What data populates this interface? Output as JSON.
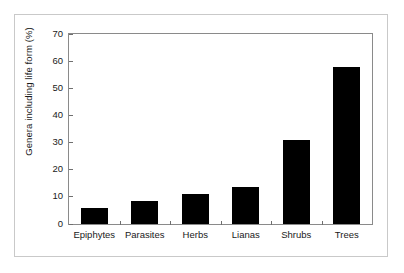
{
  "chart_data": {
    "type": "bar",
    "title": "",
    "xlabel": "",
    "ylabel": "Genera including life form (%)",
    "categories": [
      "Epiphytes",
      "Parasites",
      "Herbs",
      "Lianas",
      "Shrubs",
      "Trees"
    ],
    "values": [
      6,
      8.5,
      11,
      13.7,
      31,
      58
    ],
    "ylim": [
      0,
      70
    ],
    "yticks": [
      0,
      10,
      20,
      30,
      40,
      50,
      60,
      70
    ],
    "ytick_labels": [
      "0",
      "10",
      "20",
      "30",
      "40",
      "50",
      "60",
      "70"
    ],
    "grid": false,
    "legend": null,
    "bar_color": "#000000",
    "background_color": "#ffffff",
    "frame_color": "#8a8a8a",
    "outer_border_color": "#c9c9c9"
  }
}
